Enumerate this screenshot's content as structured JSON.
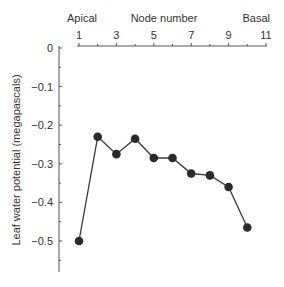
{
  "chart_data": {
    "type": "line",
    "title": "",
    "xlabel": "Node number",
    "xlabel_left": "Apical",
    "xlabel_right": "Basal",
    "ylabel": "Leaf water potential (megapascals)",
    "x_axis_position": "top",
    "x": [
      1,
      2,
      3,
      4,
      5,
      6,
      7,
      8,
      9,
      10
    ],
    "series": [
      {
        "name": "Leaf water potential",
        "values": [
          -0.5,
          -0.23,
          -0.275,
          -0.235,
          -0.285,
          -0.285,
          -0.325,
          -0.33,
          -0.36,
          -0.465
        ]
      }
    ],
    "xticks": [
      1,
      3,
      5,
      7,
      9,
      11
    ],
    "xlim": [
      1,
      11
    ],
    "yticks": [
      0,
      -0.1,
      -0.2,
      -0.3,
      -0.4,
      -0.5
    ],
    "ytick_labels": [
      "0",
      "−0.1",
      "−0.2",
      "−0.3",
      "−0.4",
      "−0.5"
    ],
    "ylim": [
      -0.58,
      0
    ],
    "grid": false,
    "legend": "none",
    "colors": {
      "line": "#3a3a3a",
      "marker": "#2a2a2a",
      "axis": "#555555",
      "text": "#333333"
    }
  }
}
